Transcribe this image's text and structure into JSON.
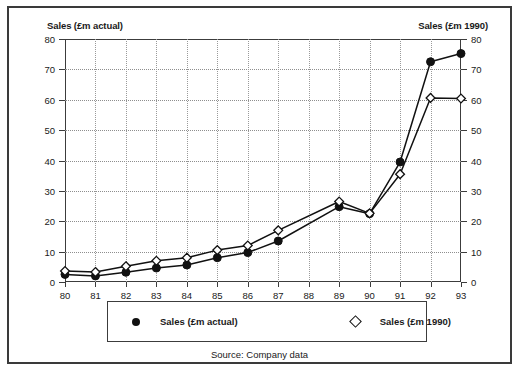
{
  "figure": {
    "left_axis_title": "Sales (£m actual)",
    "right_axis_title": "Sales (£m 1990)",
    "source_note": "Source: Company data"
  },
  "legend": {
    "entries": [
      {
        "label": "Sales (£m actual)",
        "marker": "filled-circle-marker"
      },
      {
        "label": "Sales (£m 1990)",
        "marker": "open-diamond-marker"
      }
    ]
  },
  "chart_data": {
    "type": "line",
    "title": "",
    "xlabel": "",
    "ylabel": "Sales (£m actual)",
    "y2label": "Sales (£m 1990)",
    "categories": [
      "80",
      "81",
      "82",
      "83",
      "84",
      "85",
      "86",
      "87",
      "88",
      "89",
      "90",
      "91",
      "92",
      "93"
    ],
    "xtick_labels": [
      "80",
      "81",
      "82",
      "83",
      "84",
      "85",
      "86",
      "87",
      "88",
      "89",
      "90",
      "91",
      "92",
      "93"
    ],
    "ytick_labels": [
      "0",
      "10",
      "20",
      "30",
      "40",
      "50",
      "60",
      "70",
      "80"
    ],
    "y2tick_labels": [
      "0",
      "10",
      "20",
      "30",
      "40",
      "50",
      "60",
      "70",
      "80"
    ],
    "ylim": [
      0,
      80
    ],
    "y2lim": [
      0,
      80
    ],
    "grid": true,
    "legend_position": "below-axes",
    "series": [
      {
        "name": "Sales (£m actual)",
        "axis": "left",
        "marker": "filled-circle",
        "x": [
          "80",
          "81",
          "82",
          "83",
          "84",
          "85",
          "86",
          "87",
          "89",
          "90",
          "91",
          "92",
          "93"
        ],
        "values": [
          2.5,
          2.0,
          3.2,
          4.6,
          5.6,
          8.0,
          9.7,
          13.5,
          24.8,
          22.5,
          39.5,
          72.5,
          75.2
        ]
      },
      {
        "name": "Sales (£m 1990)",
        "axis": "right",
        "marker": "open-diamond",
        "x": [
          "80",
          "81",
          "82",
          "83",
          "84",
          "85",
          "86",
          "87",
          "89",
          "90",
          "91",
          "92",
          "93"
        ],
        "values": [
          3.6,
          3.3,
          5.2,
          7.0,
          8.0,
          10.5,
          12.0,
          17.0,
          26.5,
          22.6,
          35.5,
          60.6,
          60.4
        ]
      }
    ]
  }
}
